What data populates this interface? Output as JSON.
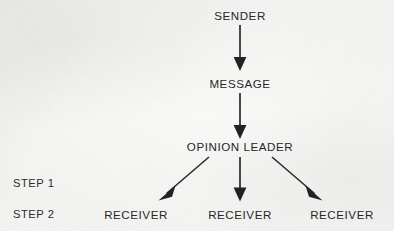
{
  "diagram": {
    "background_color": "#f6f6f5",
    "ink_color": "#262627",
    "nodes": {
      "sender": {
        "label": "SENDER",
        "x": 240,
        "y": 10
      },
      "message": {
        "label": "MESSAGE",
        "x": 240,
        "y": 78
      },
      "opinion_leader": {
        "label": "OPINION LEADER",
        "x": 240,
        "y": 141
      },
      "receiver_left": {
        "label": "RECEIVER",
        "x": 136,
        "y": 209
      },
      "receiver_center": {
        "label": "RECEIVER",
        "x": 240,
        "y": 209
      },
      "receiver_right": {
        "label": "RECEIVER",
        "x": 342,
        "y": 209
      }
    },
    "steps": [
      {
        "label": "STEP 1",
        "x": 13,
        "y": 178
      },
      {
        "label": "STEP 2",
        "x": 13,
        "y": 209
      }
    ],
    "connectors": [
      {
        "name": "sender-to-message",
        "from": "sender",
        "to": "message",
        "kind": "vertical-arrow",
        "x1": 240,
        "y1": 25,
        "x2": 240,
        "y2": 70
      },
      {
        "name": "message-to-opinion-leader",
        "from": "message",
        "to": "opinion_leader",
        "kind": "vertical-arrow",
        "x1": 240,
        "y1": 93,
        "x2": 240,
        "y2": 139
      },
      {
        "name": "opinion-leader-to-receiver-left",
        "from": "opinion_leader",
        "to": "receiver_left",
        "kind": "diagonal-arrow",
        "x1": 209,
        "y1": 157,
        "x2": 160,
        "y2": 199
      },
      {
        "name": "opinion-leader-to-receiver-center",
        "from": "opinion_leader",
        "to": "receiver_center",
        "kind": "vertical-arrow",
        "x1": 240,
        "y1": 157,
        "x2": 240,
        "y2": 201
      },
      {
        "name": "opinion-leader-to-receiver-right",
        "from": "opinion_leader",
        "to": "receiver_right",
        "kind": "diagonal-arrow",
        "x1": 272,
        "y1": 157,
        "x2": 321,
        "y2": 199
      }
    ]
  }
}
